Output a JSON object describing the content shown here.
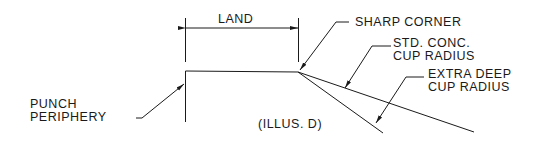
{
  "diagram": {
    "title": "(ILLUS. D)",
    "labels": {
      "land": "LAND",
      "sharp_corner": "SHARP CORNER",
      "std_conc_line1": "STD. CONC.",
      "std_conc_line2": "CUP RADIUS",
      "extra_deep_line1": "EXTRA DEEP",
      "extra_deep_line2": "CUP RADIUS",
      "punch_line1": "PUNCH",
      "punch_line2": "PERIPHERY"
    },
    "stroke_color": "#1a1a1a"
  }
}
